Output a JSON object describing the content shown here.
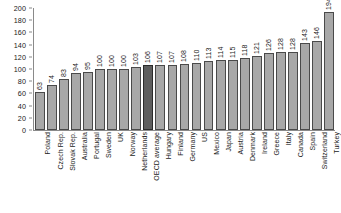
{
  "chart_data": {
    "type": "bar",
    "title": "",
    "subtitle": "",
    "xlabel": "",
    "ylabel": "",
    "ylim": [
      0,
      200
    ],
    "ytick_step": 20,
    "yticks": [
      "0",
      "20",
      "40",
      "60",
      "80",
      "100",
      "120",
      "140",
      "160",
      "180",
      "200"
    ],
    "grid": false,
    "legend": "none",
    "value_labels": true,
    "value_label_orientation": "vertical",
    "category_label_orientation": "vertical",
    "highlight_category": "OECD average",
    "colors": {
      "bar": "#a8a8a8",
      "bar_border": "#4a4a4a",
      "bar_highlight": "#5e5e5e",
      "bar_highlight_border": "#2b2b2b",
      "axis": "#8a8a8a",
      "text": "#1a1a1a",
      "background": "#ffffff"
    },
    "categories": [
      "Poland",
      "Czech Rep.",
      "Slovak Rep.",
      "Australia",
      "Portugal",
      "Sweden",
      "UK",
      "Norway",
      "Netherlands",
      "OECD average",
      "Hungary",
      "Finland",
      "Germany",
      "US",
      "Mexico",
      "Japan",
      "Austria",
      "Denmark",
      "Ireland",
      "Greece",
      "Italy",
      "Canada",
      "Spain",
      "Switzerland",
      "Turkey"
    ],
    "values": [
      63,
      74,
      83,
      94,
      95,
      100,
      100,
      100,
      103,
      106,
      107,
      107,
      108,
      110,
      113,
      114,
      115,
      118,
      121,
      126,
      128,
      128,
      143,
      146,
      194
    ]
  }
}
